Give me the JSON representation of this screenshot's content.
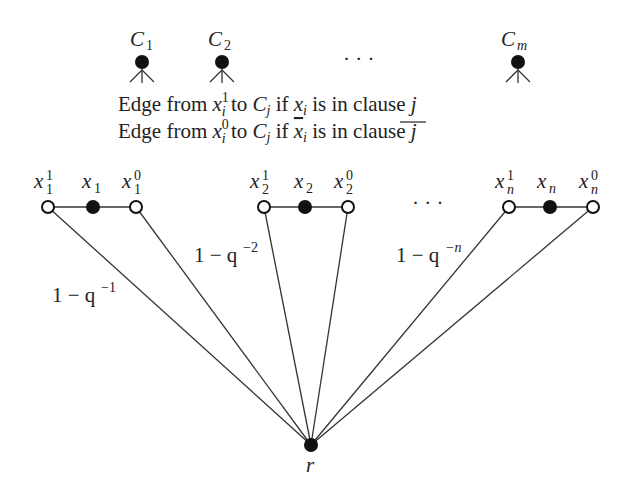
{
  "diagram": {
    "clauses": [
      {
        "name": "C",
        "sub": "1",
        "x": 142
      },
      {
        "name": "C",
        "sub": "2",
        "x": 222
      },
      {
        "name": "C",
        "sub": "m",
        "x": 518
      }
    ],
    "clause_ellipsis": "· · ·",
    "caption": {
      "line1": {
        "pre": "Edge from ",
        "var": "x",
        "sup": "1",
        "subi": "i",
        "mid": " to ",
        "c": "C",
        "cj": "j",
        "if": " if ",
        "xi": "x",
        "xi_sub": "i",
        "post": " is in clause ",
        "j": "j"
      },
      "line2": {
        "pre": "Edge from ",
        "var": "x",
        "sup": "0",
        "subi": "i",
        "mid": " to ",
        "c": "C",
        "cj": "j",
        "if": " if ",
        "xi": "x",
        "xi_sub": "i",
        "post": " is in clause ",
        "j": "j"
      }
    },
    "variable_gadgets": [
      {
        "pos_label": "x",
        "pos_sup": "1",
        "pos_sub": "1",
        "mid_label": "x",
        "mid_sub": "1",
        "neg_label": "x",
        "neg_sup": "0",
        "neg_sub": "1"
      },
      {
        "pos_label": "x",
        "pos_sup": "1",
        "pos_sub": "2",
        "mid_label": "x",
        "mid_sub": "2",
        "neg_label": "x",
        "neg_sup": "0",
        "neg_sub": "2"
      },
      {
        "pos_label": "x",
        "pos_sup": "1",
        "pos_sub": "n",
        "mid_label": "x",
        "mid_sub": "n",
        "neg_label": "x",
        "neg_sup": "0",
        "neg_sub": "n"
      }
    ],
    "variable_ellipsis": "· · ·",
    "edge_weights": [
      {
        "base": "1 − q",
        "exp": "−1"
      },
      {
        "base": "1 − q",
        "exp": "−2"
      },
      {
        "base": "1 − q",
        "exp": "−n"
      }
    ],
    "root_label": "r"
  }
}
